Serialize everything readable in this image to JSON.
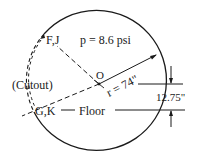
{
  "diagram": {
    "type": "fuselage-cross-section",
    "labels": {
      "pressure": "p = 8.6 psi",
      "center": "O",
      "radius": "r = 74\"",
      "upper_point": "F,J",
      "lower_point": "G,K",
      "cutout": "(Cutout)",
      "floor": "Floor",
      "floor_offset": "12.75\""
    },
    "values": {
      "pressure_psi": 8.6,
      "radius_in": 74,
      "floor_offset_in": 12.75
    },
    "colors": {
      "line": "#1a1a1a",
      "background": "#ffffff"
    }
  }
}
